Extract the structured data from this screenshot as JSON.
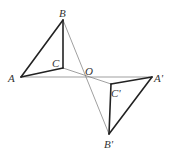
{
  "diagram": {
    "title": "",
    "points": {
      "A": {
        "x": 21,
        "y": 77,
        "label": "A",
        "lx": 8,
        "ly": 82
      },
      "B": {
        "x": 63,
        "y": 20,
        "label": "B",
        "lx": 59,
        "ly": 17
      },
      "C": {
        "x": 63,
        "y": 68,
        "label": "C",
        "lx": 52,
        "ly": 67
      },
      "O": {
        "x": 87,
        "y": 77,
        "label": "O",
        "lx": 85,
        "ly": 75
      },
      "A'": {
        "x": 152,
        "y": 77,
        "label": "A'",
        "lx": 154,
        "ly": 82
      },
      "B'": {
        "x": 109,
        "y": 134,
        "label": "B'",
        "lx": 104,
        "ly": 148
      },
      "C'": {
        "x": 111,
        "y": 84,
        "label": "C'",
        "lx": 111,
        "ly": 97
      }
    },
    "thick_segments": [
      [
        "A",
        "B"
      ],
      [
        "B",
        "C"
      ],
      [
        "A",
        "C"
      ],
      [
        "A'",
        "B'"
      ],
      [
        "B'",
        "C'"
      ],
      [
        "A'",
        "C'"
      ]
    ],
    "thin_segments": [
      [
        "A",
        "A'"
      ],
      [
        "B",
        "B'"
      ],
      [
        "C",
        "C'"
      ]
    ],
    "colors": {
      "thick": "#222222",
      "thin": "#777777",
      "label": "#333333"
    }
  }
}
